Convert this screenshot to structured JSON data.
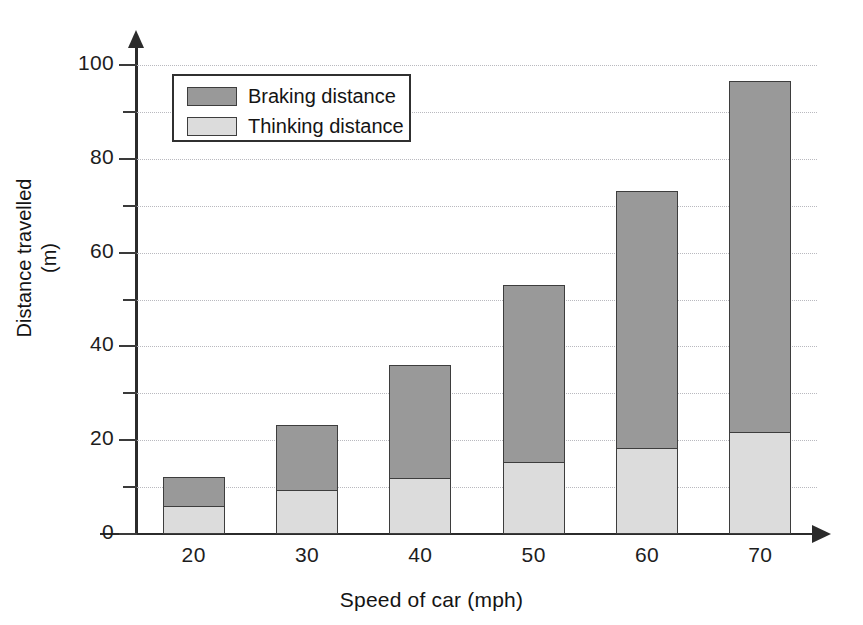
{
  "chart_data": {
    "type": "bar",
    "stacked": true,
    "title": "",
    "xlabel": "Speed of car (mph)",
    "ylabel": "Distance travelled\n(m)",
    "ylabel_line1": "Distance travelled",
    "ylabel_line2": "(m)",
    "categories": [
      "20",
      "30",
      "40",
      "50",
      "60",
      "70"
    ],
    "series": [
      {
        "name": "Thinking distance",
        "color": "#dcdcdc",
        "values": [
          6,
          9.4,
          12,
          15.4,
          18.3,
          21.8
        ]
      },
      {
        "name": "Braking distance",
        "color": "#999999",
        "values": [
          6.4,
          14.1,
          24.3,
          38.1,
          55.1,
          75.2
        ]
      }
    ],
    "totals": [
      12.4,
      23.5,
      36.3,
      53.5,
      73.4,
      97
    ],
    "ylim": [
      0,
      105
    ],
    "y_major_ticks": [
      0,
      20,
      40,
      60,
      80,
      100
    ],
    "y_minor_ticks": [
      10,
      30,
      50,
      70,
      90
    ],
    "y_tick_labels": [
      "0",
      "20",
      "40",
      "60",
      "80",
      "100"
    ],
    "grid": true,
    "grid_style": "dotted",
    "legend_position": "top-left",
    "legend_order": [
      "Braking distance",
      "Thinking distance"
    ]
  },
  "legend": {
    "items": [
      {
        "label": "Braking distance",
        "color": "#999999"
      },
      {
        "label": "Thinking distance",
        "color": "#dcdcdc"
      }
    ]
  },
  "colors": {
    "braking": "#999999",
    "thinking": "#dcdcdc",
    "axis": "#2b2b2b",
    "grid": "#b9b9bf",
    "bar_outline": "#3d3d3d",
    "background": "#ffffff"
  }
}
